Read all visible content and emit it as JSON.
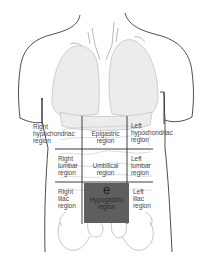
{
  "diagram": {
    "highlight_letter": "e",
    "colors": {
      "outline": "#3a3a3a",
      "organs": "#bdbdbd",
      "grid": "#2a2a2a",
      "highlight": "#5e5e5e",
      "label": "#4a4a4a"
    },
    "regions": {
      "right_hypochondriac": "Right\nhypochondriac\nregion",
      "epigastric": "Epigastric\nregion",
      "left_hypochondriac": "Left\nhypochondriac\nregion",
      "right_lumbar": "Right\nlumbar\nregion",
      "umbilical": "Umbilical\nregion",
      "left_lumbar": "Left\nlumbar\nregion",
      "right_iliac": "Right\niliac\nregion",
      "hypogastric": "Hypogastric\nregion",
      "left_iliac": "Left\niliac\nregion"
    }
  }
}
